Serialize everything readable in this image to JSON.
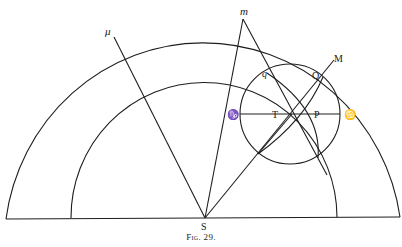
{
  "figure": {
    "caption": "Fig. 29.",
    "labels": {
      "S": "S",
      "mu": "μ",
      "m": "m",
      "M": "M",
      "Q": "Q",
      "q": "q",
      "T": "T",
      "P": "P",
      "capricorn": "♑",
      "cancer": "♋"
    },
    "colors": {
      "ink": "#1e1e1e",
      "paper": "#ffffff"
    }
  }
}
